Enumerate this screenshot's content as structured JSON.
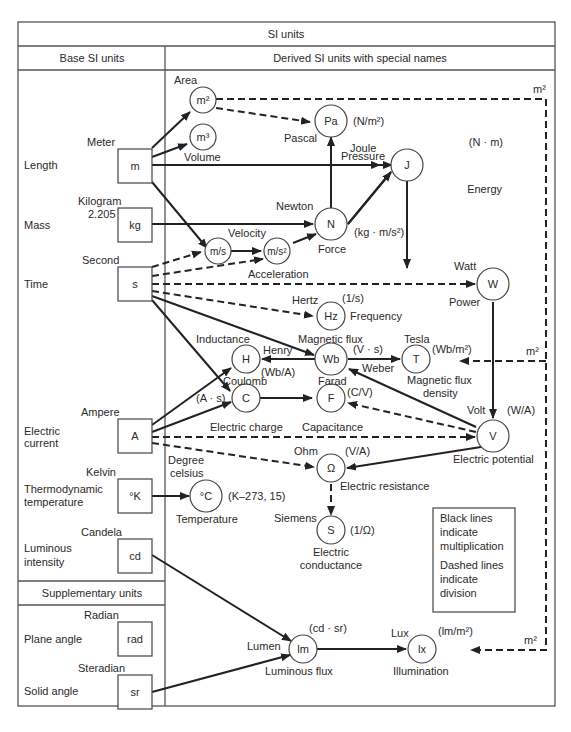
{
  "header": {
    "title": "SI units",
    "left_header": "Base SI units",
    "right_header": "Derived SI units with special names",
    "supplementary_header": "Supplementary units"
  },
  "base_units": [
    {
      "id": "m",
      "quantity": "Length",
      "name": "Meter",
      "symbol": "m"
    },
    {
      "id": "kg",
      "quantity": "Mass",
      "name": "Kilogram",
      "extra": "2.205",
      "symbol": "kg"
    },
    {
      "id": "s",
      "quantity": "Time",
      "name": "Second",
      "symbol": "s"
    },
    {
      "id": "A",
      "quantity_lines": [
        "Electric",
        "current"
      ],
      "name": "Ampere",
      "symbol": "A"
    },
    {
      "id": "K",
      "quantity_lines": [
        "Thermodynamic",
        "temperature"
      ],
      "name": "Kelvin",
      "symbol": "°K"
    },
    {
      "id": "cd",
      "quantity_lines": [
        "Luminous",
        "intensity"
      ],
      "name": "Candela",
      "symbol": "cd"
    }
  ],
  "supplementary_units": [
    {
      "id": "rad",
      "quantity": "Plane angle",
      "name": "Radian",
      "symbol": "rad"
    },
    {
      "id": "sr",
      "quantity": "Solid angle",
      "name": "Steradian",
      "symbol": "sr"
    }
  ],
  "derived_units": [
    {
      "id": "m2",
      "symbol": "m²",
      "labels": [
        "Area"
      ]
    },
    {
      "id": "m3",
      "symbol": "m³",
      "labels": [
        "Volume"
      ]
    },
    {
      "id": "Pa",
      "symbol": "Pa",
      "name": "Pascal",
      "formula": "(N/m²)",
      "quantity": "Pressure"
    },
    {
      "id": "J",
      "symbol": "J",
      "name": "Joule",
      "formula": "(N · m)",
      "quantity": "Energy"
    },
    {
      "id": "ms",
      "symbol": "m/s",
      "quantity": "Velocity"
    },
    {
      "id": "ms2",
      "symbol": "m/s²",
      "quantity": "Acceleration"
    },
    {
      "id": "N",
      "symbol": "N",
      "name": "Newton",
      "formula": "(kg · m/s²)",
      "quantity": "Force"
    },
    {
      "id": "W",
      "symbol": "W",
      "name": "Watt",
      "quantity": "Power"
    },
    {
      "id": "Hz",
      "symbol": "Hz",
      "name": "Hertz",
      "formula": "(1/s)",
      "quantity": "Frequency"
    },
    {
      "id": "H",
      "symbol": "H",
      "name": "Henry",
      "formula": "(Wb/A)",
      "quantity": "Inductance"
    },
    {
      "id": "Wb",
      "symbol": "Wb",
      "name": "Weber",
      "formula": "(V · s)",
      "quantity": "Magnetic flux"
    },
    {
      "id": "T",
      "symbol": "T",
      "name": "Tesla",
      "formula": "(Wb/m²)",
      "quantity_lines": [
        "Magnetic flux",
        "density"
      ]
    },
    {
      "id": "C",
      "symbol": "C",
      "name": "Coulomb",
      "formula": "(A · s)",
      "quantity": "Electric charge"
    },
    {
      "id": "F",
      "symbol": "F",
      "name": "Farad",
      "formula": "(C/V)",
      "quantity": "Capacitance"
    },
    {
      "id": "V",
      "symbol": "V",
      "name": "Volt",
      "formula": "(W/A)",
      "quantity": "Electric potential"
    },
    {
      "id": "Ohm",
      "symbol": "Ω",
      "name": "Ohm",
      "formula": "(V/A)",
      "quantity": "Electric resistance"
    },
    {
      "id": "S",
      "symbol": "S",
      "name": "Siemens",
      "formula": "(1/Ω)",
      "quantity_lines": [
        "Electric",
        "conductance"
      ]
    },
    {
      "id": "degC",
      "symbol": "°C",
      "name_lines": [
        "Degree",
        "celsius"
      ],
      "formula": "(K–273, 15)",
      "quantity": "Temperature"
    },
    {
      "id": "lm",
      "symbol": "lm",
      "name": "Lumen",
      "formula": "(cd · sr)",
      "quantity": "Luminous flux"
    },
    {
      "id": "lx",
      "symbol": "lx",
      "name": "Lux",
      "formula": "(lm/m²)",
      "quantity": "Illumination"
    }
  ],
  "m2_labels": [
    "m²",
    "m²",
    "m²"
  ],
  "legend": {
    "multiplication": [
      "Black lines",
      "indicate",
      "multiplication"
    ],
    "division": [
      "Dashed lines",
      "indicate",
      "division"
    ]
  },
  "colors": {
    "line": "#222222",
    "frame": "#555555",
    "text": "#2a2a2a",
    "background": "#ffffff"
  }
}
